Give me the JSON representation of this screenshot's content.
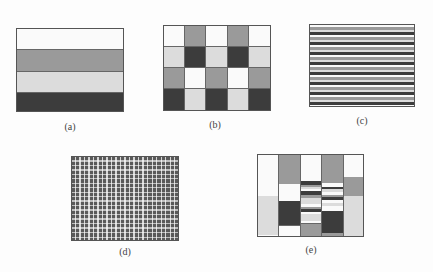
{
  "colors": {
    "white": "#fafafa",
    "light": "#dcdcdc",
    "gray": "#9a9a9a",
    "dark": "#3c3c3c"
  },
  "panels": [
    {
      "id": "a",
      "label": "(a)",
      "pattern": "horizontal-bands",
      "bands": [
        "white",
        "gray",
        "light",
        "dark"
      ]
    },
    {
      "id": "b",
      "label": "(b)",
      "pattern": "checker-grid",
      "columns": 5,
      "rows": 4,
      "cells": [
        [
          "white",
          "gray",
          "white",
          "gray",
          "white"
        ],
        [
          "light",
          "dark",
          "light",
          "dark",
          "light"
        ],
        [
          "gray",
          "white",
          "gray",
          "white",
          "gray"
        ],
        [
          "dark",
          "light",
          "dark",
          "light",
          "dark"
        ]
      ]
    },
    {
      "id": "c",
      "label": "(c)",
      "pattern": "fine-horizontal-stripes",
      "sequence": [
        "white",
        "gray",
        "light",
        "dark"
      ]
    },
    {
      "id": "d",
      "label": "(d)",
      "pattern": "fine-checker"
    },
    {
      "id": "e",
      "label": "(e)",
      "pattern": "mixed-columns"
    }
  ]
}
